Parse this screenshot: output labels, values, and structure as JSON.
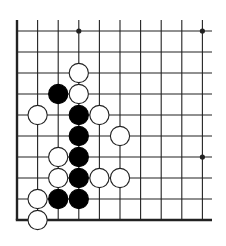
{
  "diagram": {
    "type": "go-board-fragment",
    "board_size": 19,
    "visible_region": {
      "columns": 10,
      "rows": 10,
      "edges": [
        "left",
        "bottom"
      ]
    },
    "colors": {
      "line": "#222222",
      "black_stone": "#000000",
      "white_stone_fill": "#ffffff",
      "white_stone_stroke": "#222222",
      "background": "#ffffff"
    },
    "star_points": [
      {
        "col": 3,
        "row": 0
      },
      {
        "col": 9,
        "row": 0
      },
      {
        "col": 9,
        "row": 6
      }
    ],
    "stones": [
      {
        "color": "white",
        "col": 3,
        "row": 2
      },
      {
        "color": "black",
        "col": 2,
        "row": 3
      },
      {
        "color": "white",
        "col": 3,
        "row": 3
      },
      {
        "color": "white",
        "col": 1,
        "row": 4
      },
      {
        "color": "black",
        "col": 3,
        "row": 4
      },
      {
        "color": "white",
        "col": 4,
        "row": 4
      },
      {
        "color": "black",
        "col": 3,
        "row": 5
      },
      {
        "color": "white",
        "col": 5,
        "row": 5
      },
      {
        "color": "white",
        "col": 2,
        "row": 6
      },
      {
        "color": "black",
        "col": 3,
        "row": 6
      },
      {
        "color": "white",
        "col": 2,
        "row": 7
      },
      {
        "color": "black",
        "col": 3,
        "row": 7
      },
      {
        "color": "white",
        "col": 4,
        "row": 7
      },
      {
        "color": "white",
        "col": 5,
        "row": 7
      },
      {
        "color": "white",
        "col": 1,
        "row": 8
      },
      {
        "color": "black",
        "col": 2,
        "row": 8
      },
      {
        "color": "black",
        "col": 3,
        "row": 8
      },
      {
        "color": "white",
        "col": 1,
        "row": 9
      }
    ]
  }
}
